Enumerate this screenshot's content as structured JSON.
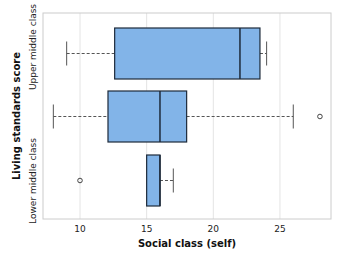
{
  "chart_data": {
    "type": "boxplot",
    "orientation": "horizontal",
    "title": "",
    "xlabel": "Social class (self)",
    "ylabel": "Living standards score",
    "xlim": [
      7.3,
      29
    ],
    "x_ticks": [
      10,
      15,
      20,
      25
    ],
    "grid": {
      "x": true,
      "y": false
    },
    "category_labels_visible": [
      "Upper middle class",
      "",
      "Lower middle class"
    ],
    "series": [
      {
        "name": "Upper middle class",
        "whisker_low": 9.0,
        "q1": 12.6,
        "median": 22.0,
        "q3": 23.5,
        "whisker_high": 24.0,
        "outliers": []
      },
      {
        "name": "",
        "whisker_low": 8.0,
        "q1": 12.1,
        "median": 16.0,
        "q3": 18.0,
        "whisker_high": 26.0,
        "outliers": [
          28.0
        ]
      },
      {
        "name": "Lower middle class",
        "whisker_low": 15.0,
        "q1": 15.0,
        "median": 16.0,
        "q3": 16.0,
        "whisker_high": 17.0,
        "outliers": [
          10.0
        ]
      }
    ],
    "colors": {
      "box_fill": "#82b4e8",
      "box_stroke": "#1d2a3a",
      "whisker": "#555555",
      "grid": "#e4e4e4",
      "frame": "#cccccc"
    }
  }
}
